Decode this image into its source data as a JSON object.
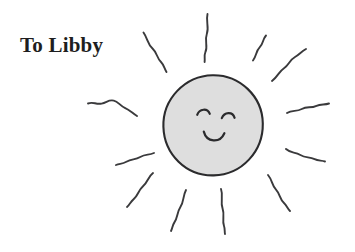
{
  "page": {
    "background_color": "#ffffff",
    "width": 355,
    "height": 252
  },
  "dedication": {
    "text": "To Libby"
  },
  "illustration": {
    "title": "smiling sun drawing",
    "sun_body": {
      "name": "sun-body",
      "fill_color": "#dedede",
      "stroke_color": "#2b2b2d",
      "center_x": 212,
      "center_y": 125,
      "radius_x": 50,
      "radius_y": 50
    },
    "face": {
      "left_eye": "arc",
      "right_eye": "arc",
      "mouth": "smile-arc",
      "stroke_color": "#2b2b2d"
    },
    "rays": {
      "count": 12,
      "stroke_color": "#3a3a3c",
      "style": "hand-drawn wavy lines"
    }
  }
}
